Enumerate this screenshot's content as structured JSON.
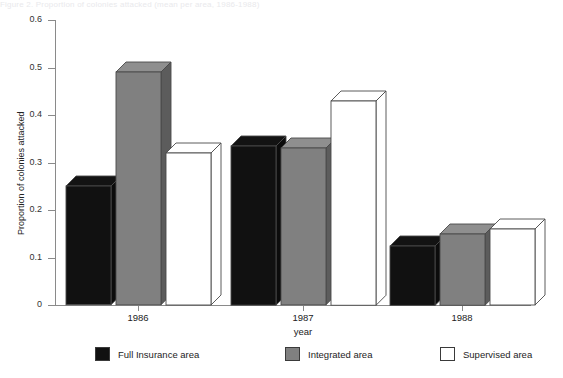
{
  "figure": {
    "caption_fragment": "Figure 2. Proportion of colonies attacked (mean per area, 1986-1988)"
  },
  "chart_data": {
    "type": "bar",
    "title": "",
    "subtitle": "",
    "xlabel": "year",
    "ylabel": "Proportion of colonies attacked",
    "categories": [
      "1986",
      "1987",
      "1988"
    ],
    "ylim": [
      0,
      0.6
    ],
    "ytick_labels": [
      "0",
      "0.1",
      "0.2",
      "0.3",
      "0.4",
      "0.5",
      "0.6"
    ],
    "ytick_values": [
      0,
      0.1,
      0.2,
      0.3,
      0.4,
      0.5,
      0.6
    ],
    "grid": false,
    "legend_position": "bottom",
    "style": "3d-bars",
    "series": [
      {
        "name": "Full Insurance area",
        "color": "#111111",
        "values": [
          0.25,
          0.335,
          0.125
        ]
      },
      {
        "name": "Integrated area",
        "color": "#808080",
        "values": [
          0.49,
          0.33,
          0.15
        ]
      },
      {
        "name": "Supervised area",
        "color": "#ffffff",
        "values": [
          0.32,
          0.43,
          0.16
        ]
      }
    ]
  },
  "axes": {
    "y_title": "Proportion of colonies attacked",
    "x_title": "year",
    "y_ticks": [
      {
        "label": "0.6",
        "value": 0.6
      },
      {
        "label": "0.5",
        "value": 0.5
      },
      {
        "label": "0.4",
        "value": 0.4
      },
      {
        "label": "0.3",
        "value": 0.3
      },
      {
        "label": "0.2",
        "value": 0.2
      },
      {
        "label": "0.1",
        "value": 0.1
      },
      {
        "label": "0",
        "value": 0
      }
    ],
    "x_categories": [
      {
        "label": "1986"
      },
      {
        "label": "1987"
      },
      {
        "label": "1988"
      }
    ]
  },
  "legend": {
    "items": [
      {
        "label": "Full Insurance area",
        "color": "#111111"
      },
      {
        "label": "Integrated area",
        "color": "#808080"
      },
      {
        "label": "Supervised area",
        "color": "#ffffff"
      }
    ]
  },
  "colors": {
    "series_full_insurance": "#111111",
    "series_integrated": "#808080",
    "series_supervised": "#ffffff",
    "axis": "#8a8a8a",
    "outline": "#4a4a4a",
    "background": "#ffffff"
  }
}
